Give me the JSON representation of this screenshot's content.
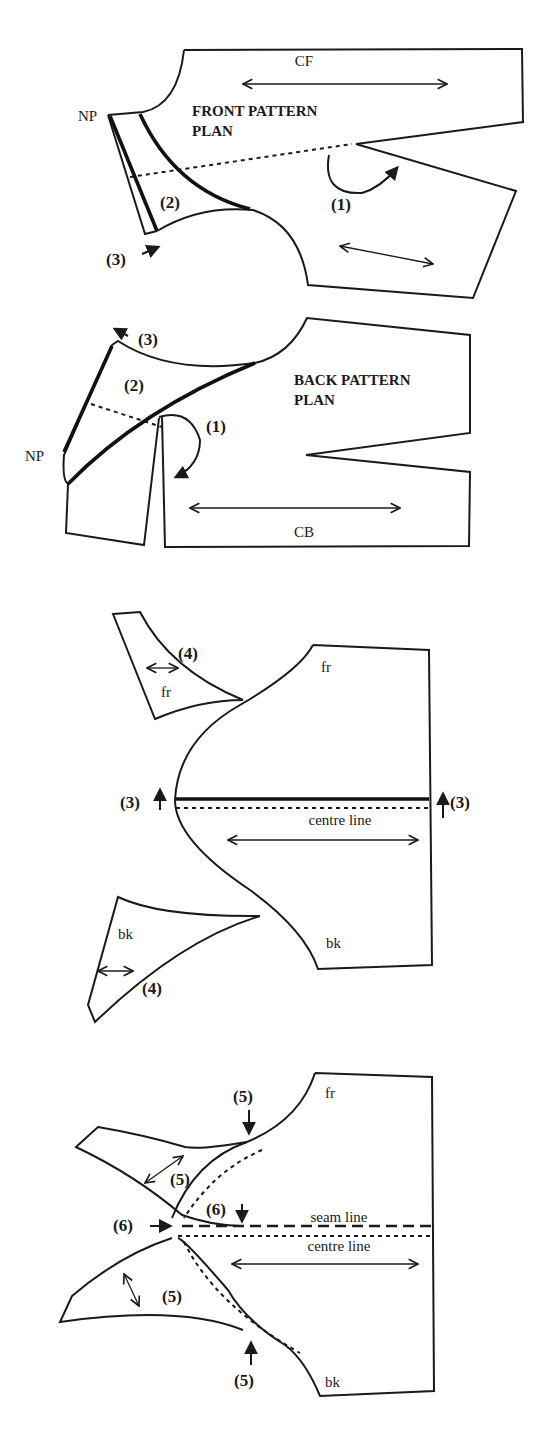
{
  "figure": {
    "front_pattern_plan": {
      "title_line1": "FRONT PATTERN",
      "title_line2": "PLAN",
      "grain_label": "CF",
      "neck_point_label": "NP",
      "steps": [
        "(1)",
        "(2)",
        "(3)"
      ]
    },
    "back_pattern_plan": {
      "title_line1": "BACK PATTERN",
      "title_line2": "PLAN",
      "grain_label": "CB",
      "neck_point_label": "NP",
      "steps": [
        "(1)",
        "(2)",
        "(3)"
      ]
    },
    "combined_pattern": {
      "front_label": "fr",
      "back_label": "bk",
      "centre_line_label": "centre line",
      "front_piece_label": "fr",
      "back_piece_label": "bk",
      "step_left": "(3)",
      "step_right": "(3)",
      "step_front_piece": "(4)",
      "step_back_piece": "(4)"
    },
    "final_pattern": {
      "front_label": "fr",
      "back_label": "bk",
      "seam_line_label": "seam line",
      "centre_line_label": "centre line",
      "step_5_top": "(5)",
      "step_5_upper_curve": "(5)",
      "step_5_lower_curve": "(5)",
      "step_5_bottom": "(5)",
      "step_6_left": "(6)",
      "step_6_top": "(6)"
    }
  }
}
